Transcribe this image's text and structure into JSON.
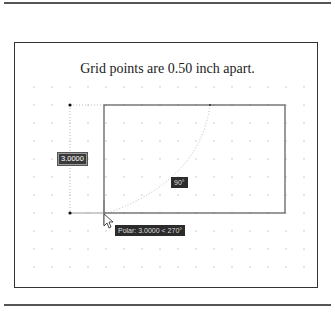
{
  "caption": "Grid points are 0.50 inch apart.",
  "dimension_input": {
    "value": "3.0000"
  },
  "angle_tooltip": {
    "value": "90°"
  },
  "polar_tooltip": {
    "text": "Polar: 3.0000 < 270°"
  },
  "grid": {
    "spacing_px": 18,
    "color": "#c8c8c8"
  },
  "colors": {
    "line": "#555555",
    "tracking": "#bbbbbb",
    "tooltip_bg": "#2b2b2b"
  }
}
